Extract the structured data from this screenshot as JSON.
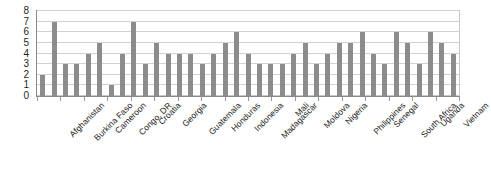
{
  "chart_data": {
    "type": "bar",
    "title": "",
    "subtitle": "",
    "xlabel": "",
    "ylabel": "",
    "ylim": [
      0,
      8
    ],
    "y_ticks": [
      0,
      1,
      2,
      3,
      4,
      5,
      6,
      7,
      8
    ],
    "grid": true,
    "legend": "none",
    "bar_color": "#8c8c8c",
    "gridline_color": "#d2d2d2",
    "axis_color": "#8a8a8a",
    "categories": [
      "Afghanistan",
      "Burkina Faso",
      "Cameroon",
      "Congo, DR",
      "Croatia",
      "Georgia",
      "Guatemala",
      "Honduras",
      "Indonesia",
      "Madagascar",
      "Mali",
      "Moldova",
      "Nigeria",
      "Philippines",
      "Senegal",
      "South Africa",
      "Uganda",
      "Vietnam"
    ],
    "series": [
      {
        "name": "Series 1",
        "values": [
          2,
          3,
          4,
          1,
          7,
          5,
          4,
          3,
          5,
          4,
          3,
          4,
          3,
          5,
          6,
          3,
          6,
          6
        ]
      },
      {
        "name": "Series 2",
        "values": [
          7,
          3,
          5,
          4,
          3,
          4,
          4,
          4,
          6,
          3,
          3,
          5,
          4,
          5,
          4,
          6,
          5,
          4
        ]
      }
    ],
    "values_flat": [
      2,
      7,
      3,
      3,
      4,
      5,
      1,
      4,
      7,
      3,
      5,
      4,
      4,
      4,
      3,
      4,
      5,
      6,
      4,
      3,
      3,
      3,
      4,
      5,
      3,
      4,
      5,
      5,
      6,
      4,
      3,
      6,
      5,
      3,
      6,
      5,
      4
    ]
  }
}
